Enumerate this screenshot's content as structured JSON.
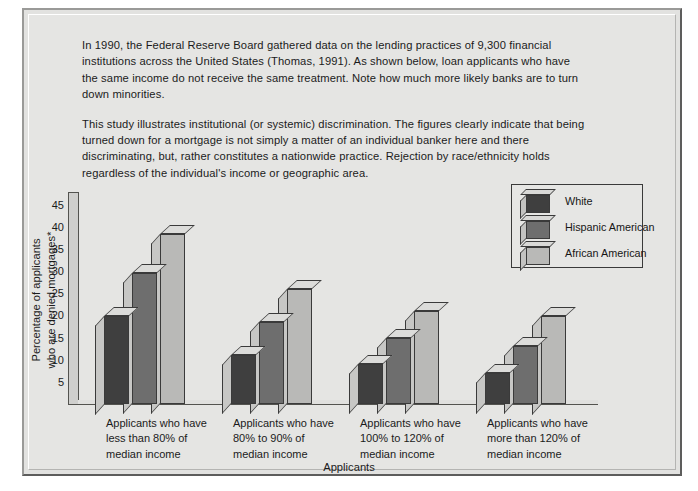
{
  "caption": {
    "paragraph1": "In 1990, the Federal Reserve Board gathered data on the lending practices of 9,300 financial institutions across the United States (Thomas, 1991). As shown below, loan applicants who have the same income do not receive the same treatment. Note how much more likely banks are to turn down minorities.",
    "paragraph2": "This study illustrates institutional (or systemic) discrimination. The figures clearly indicate that being turned down for a mortgage is not simply a matter of an individual banker here and there discriminating, but, rather constitutes a nationwide practice. Rejection by race/ethnicity holds regardless of the individual's income or geographic area."
  },
  "legend": {
    "position": "inside-top-right",
    "items": [
      {
        "label": "White",
        "color": "#3f3f3f",
        "icon": "cube-swatch-icon"
      },
      {
        "label": "Hispanic American",
        "color": "#6e6e6e",
        "icon": "cube-swatch-icon"
      },
      {
        "label": "African American",
        "color": "#b9b9b7",
        "icon": "cube-swatch-icon"
      }
    ]
  },
  "chart_data": {
    "type": "bar",
    "title": "",
    "xlabel": "Applicants",
    "ylabel": "Percentage of applicants who are denied mortgages*",
    "ylim": [
      0,
      47
    ],
    "yticks": [
      45,
      40,
      35,
      30,
      25,
      20,
      15,
      10,
      5
    ],
    "grid": false,
    "categories": [
      "Applicants who have less than 80% of median income",
      "Applicants who have 80% to 90% of median income",
      "Applicants who have 100% to 120% of median income",
      "Applicants who have more than 120% of median income"
    ],
    "category_lines": [
      [
        "Applicants who have",
        "less than 80% of",
        "median income"
      ],
      [
        "Applicants who have",
        "80% to 90% of",
        "median income"
      ],
      [
        "Applicants who have",
        "100% to 120% of",
        "median income"
      ],
      [
        "Applicants who have",
        "more than 120% of",
        "median income"
      ]
    ],
    "series": [
      {
        "name": "White",
        "color": "#3f3f3f",
        "values": [
          20,
          11,
          9,
          7
        ]
      },
      {
        "name": "Hispanic American",
        "color": "#6e6e6e",
        "values": [
          29.5,
          18.5,
          15,
          13
        ]
      },
      {
        "name": "African American",
        "color": "#b9b9b7",
        "values": [
          38.5,
          26,
          21,
          20
        ]
      }
    ]
  },
  "axis": {
    "ylabel_line1": "Percentage of applicants",
    "ylabel_line2": "who are denied mortgages*"
  }
}
